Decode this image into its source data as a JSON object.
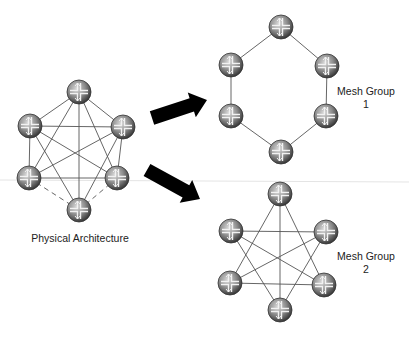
{
  "diagram": {
    "labels": {
      "physical": "Physical Architecture",
      "group1_line1": "Mesh Group",
      "group1_line2": "1",
      "group2_line1": "Mesh Group",
      "group2_line2": "2"
    },
    "colors": {
      "edge": "#555555",
      "arrow": "#000000",
      "router_fill": "#8a8a8a",
      "router_dark": "#3a3a3a",
      "background": "#ffffff"
    },
    "icons": {
      "node": "router-icon",
      "transition": "arrow-icon"
    },
    "physical": {
      "nodes": [
        [
          79,
          92
        ],
        [
          30,
          126
        ],
        [
          123,
          127
        ],
        [
          29,
          178
        ],
        [
          117,
          178
        ],
        [
          79,
          210
        ]
      ],
      "edges": [
        [
          0,
          1
        ],
        [
          0,
          2
        ],
        [
          0,
          3
        ],
        [
          0,
          4
        ],
        [
          0,
          5
        ],
        [
          1,
          2
        ],
        [
          1,
          3
        ],
        [
          1,
          4
        ],
        [
          1,
          5
        ],
        [
          2,
          3
        ],
        [
          2,
          4
        ],
        [
          2,
          5
        ],
        [
          3,
          4
        ]
      ],
      "dashed_edges": [
        [
          3,
          5
        ],
        [
          4,
          5
        ]
      ]
    },
    "group1": {
      "nodes": [
        [
          281,
          27
        ],
        [
          231,
          65
        ],
        [
          327,
          66
        ],
        [
          231,
          116
        ],
        [
          326,
          116
        ],
        [
          281,
          152
        ]
      ],
      "edges": [
        [
          0,
          1
        ],
        [
          0,
          2
        ],
        [
          1,
          3
        ],
        [
          2,
          4
        ],
        [
          3,
          5
        ],
        [
          4,
          5
        ]
      ]
    },
    "group2": {
      "nodes": [
        [
          280,
          194
        ],
        [
          231,
          231
        ],
        [
          326,
          232
        ],
        [
          230,
          283
        ],
        [
          324,
          285
        ],
        [
          280,
          310
        ]
      ],
      "edges": [
        [
          0,
          3
        ],
        [
          0,
          4
        ],
        [
          0,
          5
        ],
        [
          1,
          2
        ],
        [
          1,
          4
        ],
        [
          1,
          5
        ],
        [
          2,
          3
        ],
        [
          2,
          5
        ],
        [
          3,
          4
        ]
      ]
    },
    "arrows": [
      {
        "from": [
          152,
          118
        ],
        "to": [
          207,
          100
        ]
      },
      {
        "from": [
          147,
          170
        ],
        "to": [
          200,
          199
        ]
      }
    ]
  }
}
